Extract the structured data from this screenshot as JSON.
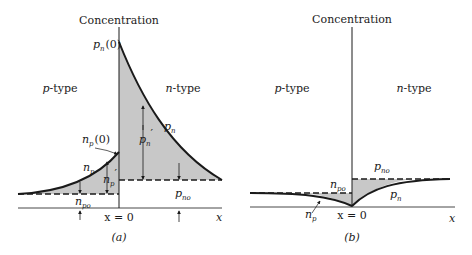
{
  "panels": [
    {
      "id": "a",
      "caption": "(a)",
      "axis_label": "Concentration",
      "left_region": "p-type",
      "right_region": "n-type",
      "x_axis_label": "x",
      "origin_label": "x = 0",
      "labels": {
        "pn0": "p",
        "pn0_sub": "n",
        "pn0_arg": "(0)",
        "np0": "n",
        "np0_sub": "p",
        "np0_arg": "(0)",
        "pn_curve": "p",
        "pn_curve_sub": "n",
        "pn_prime": "p",
        "pn_prime_sub": "n",
        "np_curve": "n",
        "np_curve_sub": "p",
        "np_prime": "n",
        "np_prime_sub": "p",
        "npo": "n",
        "npo_sub": "po",
        "pno": "p",
        "pno_sub": "no",
        "prime": "′"
      }
    },
    {
      "id": "b",
      "caption": "(b)",
      "axis_label": "Concentration",
      "left_region": "p-type",
      "right_region": "n-type",
      "x_axis_label": "x",
      "origin_label": "x = 0",
      "labels": {
        "pno": "p",
        "pno_sub": "no",
        "npo": "n",
        "npo_sub": "po",
        "pn_curve": "p",
        "pn_curve_sub": "n",
        "np_curve": "n",
        "np_curve_sub": "p"
      }
    }
  ],
  "colors": {
    "shade": "#c8c8c8",
    "line": "#1a1a1a"
  }
}
